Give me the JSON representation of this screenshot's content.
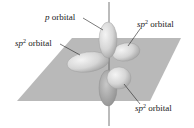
{
  "figure": {
    "labels": {
      "p_orbital": {
        "italic": "p",
        "text": " orbital"
      },
      "sp2_upper_right": {
        "italic": "sp",
        "sup": "2",
        "text": " orbital"
      },
      "sp2_left": {
        "italic": "sp",
        "sup": "2",
        "text": " orbital"
      },
      "sp2_lower_right": {
        "italic": "sp",
        "sup": "2",
        "text": " orbital"
      }
    },
    "colors": {
      "plane": "#b8b8b8",
      "lobe": "#d9d9d9",
      "lobe_dark": "#a9a9a9",
      "axis": "#555555",
      "leader": "#222222"
    }
  }
}
